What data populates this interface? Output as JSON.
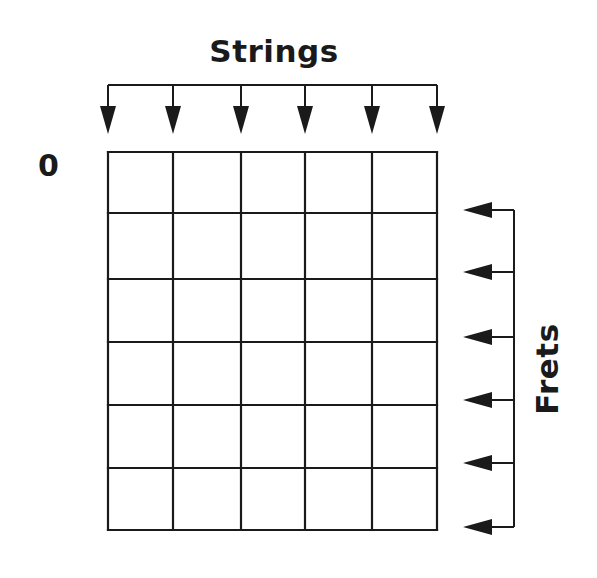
{
  "diagram": {
    "labels": {
      "strings": "Strings",
      "frets": "Frets",
      "starting_fret": "0"
    },
    "strings": {
      "count": 6,
      "x_positions": [
        108,
        173,
        241,
        305,
        372,
        437
      ],
      "arrow_direction": "down"
    },
    "frets": {
      "count": 6,
      "y_positions": [
        152,
        213,
        279,
        342,
        405,
        468,
        530
      ],
      "arrow_y_positions": [
        210,
        272,
        337,
        400,
        463,
        527
      ],
      "arrow_direction": "left"
    },
    "colors": {
      "line": "#1a1a1a",
      "background": "#ffffff"
    }
  }
}
